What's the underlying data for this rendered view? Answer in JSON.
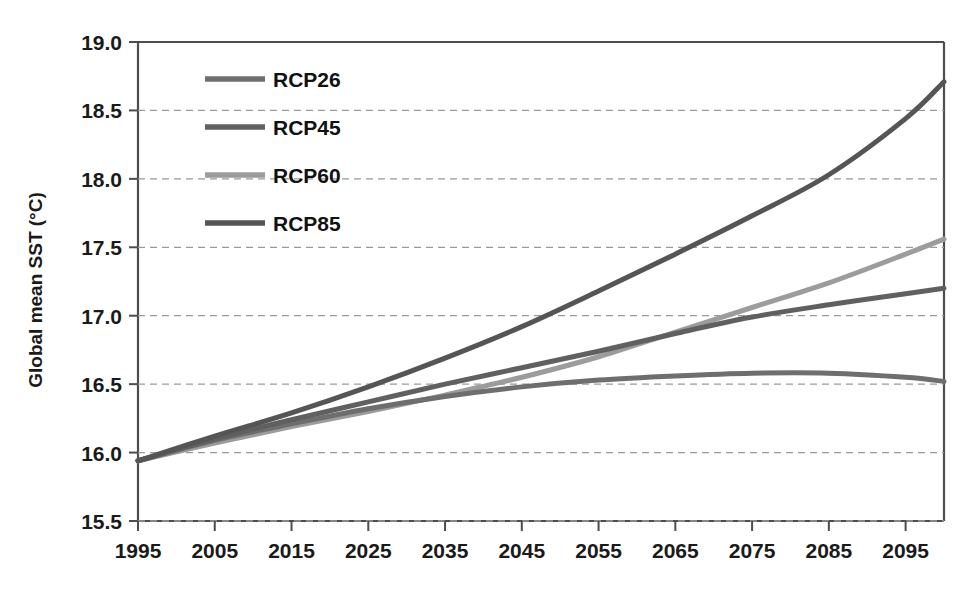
{
  "chart_data": {
    "type": "line",
    "title": "",
    "xlabel": "",
    "ylabel": "Global mean SST (°C)",
    "xlim": [
      1995,
      2100
    ],
    "ylim": [
      15.5,
      19.0
    ],
    "grid": true,
    "legend_position": "top-left-inside",
    "x_ticks": [
      "1995",
      "2005",
      "2015",
      "2025",
      "2035",
      "2045",
      "2055",
      "2065",
      "2075",
      "2085",
      "2095"
    ],
    "x_tick_values": [
      1995,
      2005,
      2015,
      2025,
      2035,
      2045,
      2055,
      2065,
      2075,
      2085,
      2095
    ],
    "y_ticks": [
      "15.5",
      "16.0",
      "16.5",
      "17.0",
      "17.5",
      "18.0",
      "18.5",
      "19.0"
    ],
    "y_tick_values": [
      15.5,
      16.0,
      16.5,
      17.0,
      17.5,
      18.0,
      18.5,
      19.0
    ],
    "x": [
      1995,
      2005,
      2015,
      2025,
      2035,
      2045,
      2055,
      2065,
      2075,
      2085,
      2095,
      2100
    ],
    "series": [
      {
        "name": "RCP26",
        "color": "#6e6e6e",
        "width": 5.0,
        "values": [
          15.94,
          16.09,
          16.21,
          16.32,
          16.41,
          16.48,
          16.53,
          16.56,
          16.58,
          16.58,
          16.55,
          16.52
        ]
      },
      {
        "name": "RCP45",
        "color": "#606060",
        "width": 5.0,
        "values": [
          15.94,
          16.1,
          16.24,
          16.37,
          16.5,
          16.62,
          16.74,
          16.87,
          16.99,
          17.08,
          17.16,
          17.2
        ]
      },
      {
        "name": "RCP60",
        "color": "#9c9c9c",
        "width": 5.0,
        "values": [
          15.94,
          16.07,
          16.19,
          16.3,
          16.42,
          16.55,
          16.7,
          16.88,
          17.06,
          17.24,
          17.45,
          17.56
        ]
      },
      {
        "name": "RCP85",
        "color": "#555555",
        "width": 5.0,
        "values": [
          15.94,
          16.12,
          16.29,
          16.48,
          16.69,
          16.92,
          17.18,
          17.45,
          17.73,
          18.03,
          18.44,
          18.71
        ]
      }
    ]
  },
  "legend": {
    "entries": [
      {
        "label": "RCP26",
        "color": "#6e6e6e"
      },
      {
        "label": "RCP45",
        "color": "#606060"
      },
      {
        "label": "RCP60",
        "color": "#9c9c9c"
      },
      {
        "label": "RCP85",
        "color": "#555555"
      }
    ]
  },
  "axes": {
    "y_title": "Global mean SST (°C)"
  }
}
